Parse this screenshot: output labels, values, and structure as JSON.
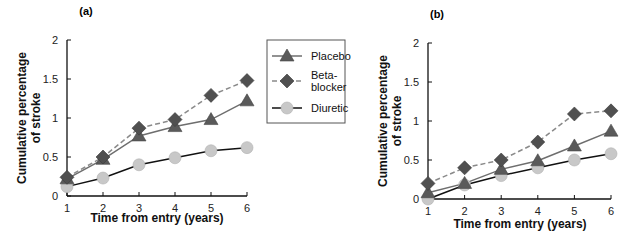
{
  "figure": {
    "legend": {
      "entries": [
        {
          "label_lines": [
            "Placebo"
          ],
          "series": "placebo"
        },
        {
          "label_lines": [
            "Beta-",
            "blocker"
          ],
          "series": "beta_blocker"
        },
        {
          "label_lines": [
            "Diuretic"
          ],
          "series": "diuretic"
        }
      ]
    },
    "styles": {
      "placebo": {
        "marker": "triangle",
        "marker_color": "#5a5a5a",
        "line_color": "#6e6e6e",
        "dash": ""
      },
      "beta_blocker": {
        "marker": "diamond",
        "marker_color": "#505050",
        "line_color": "#8a8a8a",
        "dash": "5,3"
      },
      "diuretic": {
        "marker": "circle",
        "marker_color": "#c8c8c8",
        "line_color": "#111111",
        "dash": ""
      }
    }
  },
  "chart_data": [
    {
      "type": "line",
      "panel": "(a)",
      "title": "(a)",
      "xlabel": "Time from entry (years)",
      "ylabel": "Cumulative percentage of stroke",
      "ylabel_lines": [
        "Cumulative percentage",
        "of stroke"
      ],
      "x": [
        1,
        2,
        3,
        4,
        5,
        6
      ],
      "xticks": [
        "1",
        "2",
        "3",
        "4",
        "5",
        "6"
      ],
      "yticks": [
        "0",
        "0.5",
        "1",
        "1.5",
        "2"
      ],
      "ylim": [
        0,
        2
      ],
      "xlim": [
        1,
        6
      ],
      "grid": false,
      "legend_position": "right, between panels",
      "series": [
        {
          "key": "placebo",
          "name": "Placebo",
          "values": [
            0.22,
            0.47,
            0.77,
            0.89,
            0.98,
            1.22
          ]
        },
        {
          "key": "beta_blocker",
          "name": "Beta-blocker",
          "values": [
            0.24,
            0.5,
            0.87,
            0.98,
            1.29,
            1.48
          ]
        },
        {
          "key": "diuretic",
          "name": "Diuretic",
          "values": [
            0.12,
            0.23,
            0.4,
            0.49,
            0.58,
            0.62
          ]
        }
      ]
    },
    {
      "type": "line",
      "panel": "(b)",
      "title": "(b)",
      "xlabel": "Time from entry (years)",
      "ylabel": "Cumulative percentage of stroke",
      "ylabel_lines": [
        "Cumulative percentage",
        "of stroke"
      ],
      "x": [
        1,
        2,
        3,
        4,
        5,
        6
      ],
      "xticks": [
        "1",
        "2",
        "3",
        "4",
        "5",
        "6"
      ],
      "yticks": [
        "0",
        "0.5",
        "1",
        "1.5",
        "2"
      ],
      "ylim": [
        0,
        2
      ],
      "xlim": [
        1,
        6
      ],
      "grid": false,
      "series": [
        {
          "key": "placebo",
          "name": "Placebo",
          "values": [
            0.08,
            0.2,
            0.38,
            0.49,
            0.68,
            0.87
          ]
        },
        {
          "key": "beta_blocker",
          "name": "Beta-blocker",
          "values": [
            0.2,
            0.4,
            0.5,
            0.73,
            1.09,
            1.13
          ]
        },
        {
          "key": "diuretic",
          "name": "Diuretic",
          "values": [
            0.0,
            0.18,
            0.3,
            0.4,
            0.5,
            0.58
          ]
        }
      ]
    }
  ]
}
